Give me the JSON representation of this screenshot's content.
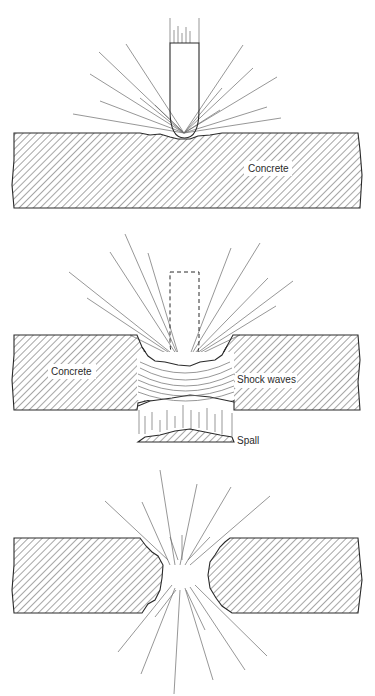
{
  "figure": {
    "colors": {
      "ink": "#2a2a2a",
      "hatch": "#6a6a6a",
      "background": "#ffffff"
    }
  },
  "panels": [
    {
      "id": "impact",
      "labels": {
        "material": "Concrete"
      }
    },
    {
      "id": "shock",
      "labels": {
        "material": "Concrete",
        "waves": "Shock waves",
        "spall": "Spall"
      }
    },
    {
      "id": "perforation",
      "labels": {}
    }
  ]
}
